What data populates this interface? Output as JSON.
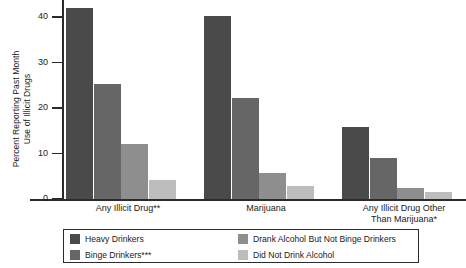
{
  "chart_data": {
    "type": "bar",
    "title": "",
    "xlabel": "",
    "ylabel": "Percent Reporting Past Month Use of Illicit Drugs",
    "ylabel_lines": [
      "Percent Reporting Past Month",
      "Use of Illicit Drugs"
    ],
    "ylim": [
      0,
      42
    ],
    "yticks": [
      0,
      10,
      20,
      30,
      40
    ],
    "ytick_labels": [
      "0",
      "10",
      "20",
      "30",
      "40"
    ],
    "grid": false,
    "legend_position": "bottom",
    "categories": [
      "Any Illicit Drug**",
      "Marijuana",
      "Any Illicit Drug Other Than Marijuana*"
    ],
    "category_lines": [
      [
        "Any Illicit Drug**"
      ],
      [
        "Marijuana"
      ],
      [
        "Any Illicit Drug Other",
        "Than Marijuana*"
      ]
    ],
    "series": [
      {
        "name": "Heavy Drinkers",
        "color": "#4a4a4a",
        "values": [
          42.0,
          40.2,
          15.8
        ]
      },
      {
        "name": "Binge Drinkers***",
        "color": "#666666",
        "values": [
          25.3,
          22.2,
          9.0
        ]
      },
      {
        "name": "Drank Alcohol But Not Binge Drinkers",
        "color": "#8e8e8e",
        "values": [
          12.0,
          5.8,
          2.5
        ]
      },
      {
        "name": "Did Not Drink Alcohol",
        "color": "#bdbdbd",
        "values": [
          4.2,
          2.8,
          1.5
        ]
      }
    ]
  },
  "legend": {
    "entries": [
      {
        "label": "Heavy Drinkers",
        "color": "#4a4a4a"
      },
      {
        "label": "Binge Drinkers***",
        "color": "#666666"
      },
      {
        "label": "Drank Alcohol But Not Binge Drinkers",
        "color": "#8e8e8e"
      },
      {
        "label": "Did Not Drink Alcohol",
        "color": "#bdbdbd"
      }
    ]
  }
}
